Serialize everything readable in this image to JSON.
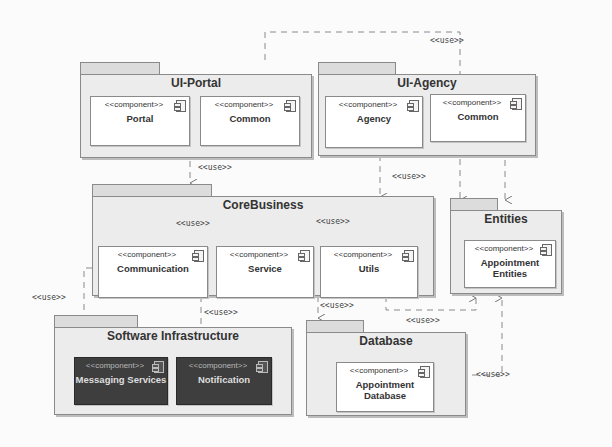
{
  "diagram": {
    "type": "UML component diagram",
    "stereotype_component": "<<component>>",
    "dependency_label": "<<use>>",
    "colors": {
      "package_fill": "#ececec",
      "package_tab": "#dcdcdc",
      "component_fill": "#ffffff",
      "component_dark_fill": "#3e3e3e",
      "line": "#8a8a8a"
    }
  },
  "packages": {
    "ui_portal": {
      "title": "UI-Portal",
      "components": [
        {
          "stereotype": "<<component>>",
          "name": "Portal"
        },
        {
          "stereotype": "<<component>>",
          "name": "Common"
        }
      ]
    },
    "ui_agency": {
      "title": "UI-Agency",
      "components": [
        {
          "stereotype": "<<component>>",
          "name": "Agency"
        },
        {
          "stereotype": "<<component>>",
          "name": "Common"
        }
      ]
    },
    "core_business": {
      "title": "CoreBusiness",
      "components": [
        {
          "stereotype": "<<component>>",
          "name": "Communication"
        },
        {
          "stereotype": "<<component>>",
          "name": "Service"
        },
        {
          "stereotype": "<<component>>",
          "name": "Utils"
        }
      ]
    },
    "entities": {
      "title": "Entities",
      "components": [
        {
          "stereotype": "<<component>>",
          "name": "Appointment Entities"
        }
      ]
    },
    "software_infrastructure": {
      "title": "Software Infrastructure",
      "components": [
        {
          "stereotype": "<<component>>",
          "name": "Messaging Services"
        },
        {
          "stereotype": "<<component>>",
          "name": "Notification"
        }
      ]
    },
    "database": {
      "title": "Database",
      "components": [
        {
          "stereotype": "<<component>>",
          "name": "Appointment Database"
        }
      ]
    }
  },
  "dependencies": [
    {
      "from": "UI-Portal",
      "to": "Entities",
      "label": "<<use>>"
    },
    {
      "from": "UI-Portal",
      "to": "CoreBusiness",
      "label": "<<use>>"
    },
    {
      "from": "UI-Agency",
      "to": "CoreBusiness",
      "label": "<<use>>"
    },
    {
      "from": "UI-Agency",
      "to": "Entities",
      "label": "<<use>>"
    },
    {
      "from": "Communication",
      "to": "Service",
      "label": "<<use>>"
    },
    {
      "from": "Service",
      "to": "Utils",
      "label": "<<use>>"
    },
    {
      "from": "Communication",
      "to": "Messaging Services",
      "label": "<<use>>"
    },
    {
      "from": "CoreBusiness",
      "to": "Notification",
      "label": "<<use>>"
    },
    {
      "from": "CoreBusiness",
      "to": "Database",
      "label": "<<use>>"
    },
    {
      "from": "CoreBusiness",
      "to": "Entities",
      "label": "<<use>>"
    },
    {
      "from": "Database",
      "to": "Entities",
      "label": "<<use>>"
    }
  ],
  "labels": {
    "use": "<<use>>"
  }
}
